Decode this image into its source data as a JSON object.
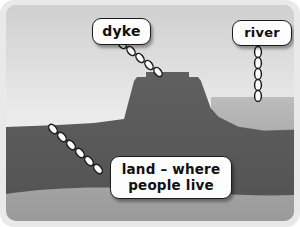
{
  "diagram": {
    "labels": [
      {
        "id": "dyke",
        "text": "dyke"
      },
      {
        "id": "river",
        "text": "river"
      },
      {
        "id": "land",
        "text": "land – where\npeople live"
      }
    ],
    "connectors": [
      {
        "id": "dyke-chain",
        "from": "dyke-label",
        "to": "dyke-crest",
        "orientation": "diagonal",
        "links": 5
      },
      {
        "id": "river-chain",
        "from": "river-label",
        "to": "river-water",
        "orientation": "vertical",
        "links": 5
      },
      {
        "id": "land-chain",
        "from": "land-label",
        "to": "land-surface",
        "orientation": "diagonal",
        "links": 6
      }
    ],
    "regions": [
      {
        "id": "sky",
        "name": "sky"
      },
      {
        "id": "land-mound",
        "name": "dyke and land"
      },
      {
        "id": "river-water",
        "name": "river water"
      },
      {
        "id": "subsoil",
        "name": "subsoil layer"
      }
    ],
    "colors": {
      "frame": "#e9e9e9",
      "sky_top": "#d2d2d2",
      "sky_bottom": "#fbfbfb",
      "land": "#5a5a5a",
      "water_top": "#b6b6b6",
      "water_bottom": "#8c8c8c",
      "subsoil": "#9d9d9d",
      "label_fill": "#fdfdfd",
      "label_border": "#1b1b1b",
      "chain_fill": "#ffffff",
      "chain_stroke": "#1e1e1e"
    }
  }
}
